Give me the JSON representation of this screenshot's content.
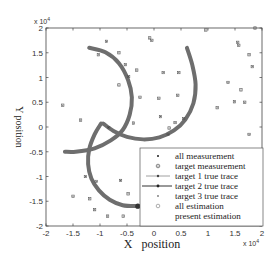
{
  "chart_data": {
    "type": "scatter",
    "title": "",
    "xlabel": "X   position",
    "ylabel": "Y position",
    "xlim": [
      -20000,
      20000
    ],
    "ylim": [
      -20000,
      20000
    ],
    "x_exponent_label": "x 10",
    "x_exponent_power": "4",
    "y_exponent_label": "x 10",
    "y_exponent_power": "4",
    "xticks": [
      -2,
      -1.5,
      -1,
      -0.5,
      0,
      0.5,
      1,
      1.5,
      2
    ],
    "xtick_labels": [
      "-2",
      "-1.5",
      "-1",
      "-0.5",
      "0",
      "0.5",
      "1",
      "1.5",
      "2"
    ],
    "yticks": [
      -2,
      -1.5,
      -1,
      -0.5,
      0,
      0.5,
      1,
      1.5,
      2
    ],
    "ytick_labels": [
      "-2",
      "-1.5",
      "-1",
      "-0.5",
      "0",
      "0.5",
      "1",
      "1.5",
      "2"
    ],
    "grid": false,
    "legend_position": "lower right",
    "legend": [
      "all measurement",
      "target measurement",
      "target 1 true trace",
      "target 2 true trace",
      "target 3 true trace",
      "all estimation",
      "present estimation"
    ],
    "series": [
      {
        "name": "all measurement",
        "marker": "x",
        "points": [
          [
            -16900,
            4400
          ],
          [
            -13600,
            1400
          ],
          [
            -10300,
            14600
          ],
          [
            -8800,
            17300
          ],
          [
            -6500,
            15000
          ],
          [
            -6500,
            8500
          ],
          [
            -5300,
            12600
          ],
          [
            -3800,
            800
          ],
          [
            -2600,
            6000
          ],
          [
            -3200,
            11500
          ],
          [
            -4700,
            10200
          ],
          [
            -800,
            18000
          ],
          [
            -400,
            17500
          ],
          [
            1700,
            11000
          ],
          [
            900,
            5800
          ],
          [
            1200,
            2100
          ],
          [
            2800,
            -200
          ],
          [
            4600,
            11000
          ],
          [
            4400,
            6400
          ],
          [
            2600,
            -1500
          ],
          [
            3900,
            900
          ],
          [
            5500,
            1700
          ],
          [
            9600,
            19600
          ],
          [
            11700,
            3900
          ],
          [
            13700,
            9000
          ],
          [
            15500,
            17100
          ],
          [
            15700,
            16500
          ],
          [
            17600,
            14600
          ],
          [
            18200,
            12200
          ],
          [
            16100,
            7500
          ],
          [
            14900,
            5100
          ],
          [
            16800,
            5000
          ],
          [
            18700,
            20000
          ],
          [
            17600,
            -1500
          ],
          [
            -8400,
            -100
          ],
          [
            -12700,
            -10000
          ],
          [
            -10700,
            -11000
          ],
          [
            -6200,
            -10800
          ],
          [
            -15000,
            -14000
          ],
          [
            -11900,
            -14500
          ],
          [
            -11000,
            -16700
          ],
          [
            -8600,
            -18000
          ],
          [
            -4800,
            -13500
          ],
          [
            -5700,
            -18000
          ]
        ]
      },
      {
        "name": "target 1 true trace",
        "points": [
          [
            -12000,
            16000
          ],
          [
            -9000,
            15100
          ],
          [
            -6500,
            12900
          ],
          [
            -4800,
            9500
          ],
          [
            -4100,
            6000
          ],
          [
            -4500,
            2500
          ],
          [
            -5800,
            -600
          ],
          [
            -8000,
            -2700
          ],
          [
            -11000,
            -4300
          ],
          [
            -14500,
            -5000
          ],
          [
            -16500,
            -5000
          ]
        ]
      },
      {
        "name": "target 2 true trace",
        "points": [
          [
            -9400,
            700
          ],
          [
            -7500,
            -800
          ],
          [
            -5000,
            -2000
          ],
          [
            -2000,
            -2500
          ],
          [
            1000,
            -2100
          ],
          [
            3700,
            -700
          ],
          [
            5800,
            1500
          ],
          [
            7300,
            4800
          ],
          [
            7700,
            8600
          ],
          [
            7100,
            12500
          ],
          [
            6100,
            16000
          ]
        ]
      },
      {
        "name": "target 3 true trace",
        "points": [
          [
            -9800,
            700
          ],
          [
            -11000,
            -1500
          ],
          [
            -12000,
            -4500
          ],
          [
            -12200,
            -7500
          ],
          [
            -11600,
            -10400
          ],
          [
            -10200,
            -12800
          ],
          [
            -8200,
            -14700
          ],
          [
            -5800,
            -15800
          ],
          [
            -3000,
            -16000
          ]
        ]
      },
      {
        "name": "present estimation",
        "points": [
          [
            -3000,
            -16000
          ]
        ]
      }
    ]
  }
}
